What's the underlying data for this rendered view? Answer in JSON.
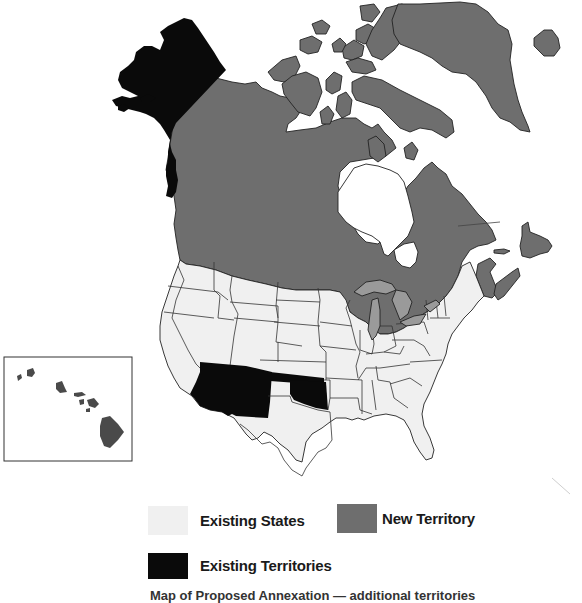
{
  "map": {
    "title": "North America territorial map",
    "colors": {
      "existing_states": "#f0f0f0",
      "new_territory": "#6e6e6e",
      "existing_territories": "#0a0a0a",
      "great_lakes": "#9a9a9a",
      "hawaii_islands": "#4a4a4a",
      "background": "#ffffff"
    },
    "regions": {
      "existing_territories": [
        "Alaska",
        "Arizona",
        "New Mexico",
        "Oklahoma"
      ],
      "new_territory": [
        "Canada",
        "Greenland",
        "Iceland"
      ],
      "existing_states": [
        "Contiguous United States (remaining states)"
      ]
    },
    "inset": {
      "name": "Hawaii inset",
      "islands": [
        "Kauai",
        "Niihau",
        "Oahu",
        "Molokai",
        "Lanai",
        "Maui",
        "Kahoolawe",
        "Hawaii"
      ]
    }
  },
  "legend": {
    "items": [
      {
        "label": "Existing States",
        "swatch": "existing_states"
      },
      {
        "label": "New Territory",
        "swatch": "new_territory"
      },
      {
        "label": "Existing Territories",
        "swatch": "existing_territories"
      }
    ],
    "caption_partial": "Map of Proposed Annexation — additional territories"
  }
}
